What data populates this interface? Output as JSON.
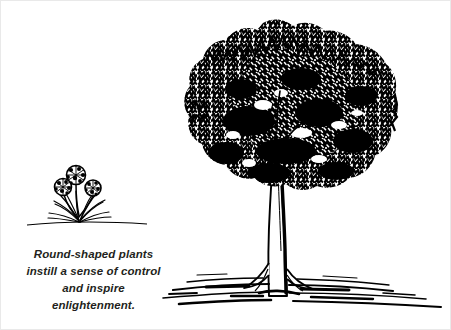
{
  "artwork": {
    "title": "Round-shaped plants landscape sketch",
    "style": "pen-and-ink line drawing",
    "ink_color": "#000000",
    "background_color": "#ffffff",
    "border_color": "#e9e9e9"
  },
  "caption": {
    "full_text": "Round-shaped plants instill a sense of control and inspire enlightenment.",
    "lines": [
      "Round-shaped plants",
      "instill a sense of control",
      "and inspire",
      "enlightenment."
    ],
    "text_color": "#231f20"
  },
  "elements": {
    "tree": {
      "name": "large deciduous tree",
      "canopy_label": "dense scratchy foliage canopy",
      "trunk_label": "tapered shaded trunk with flared roots"
    },
    "small_plant": {
      "name": "round-headed flowering plant",
      "flower_count": 3,
      "flower_label": "pom-pom flower head",
      "foliage_label": "grassy leaf clump"
    },
    "ground": {
      "name": "ground line",
      "label": "horizontal streaked ground strokes"
    }
  }
}
